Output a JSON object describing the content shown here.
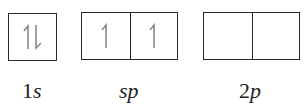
{
  "diagram": {
    "groups": [
      {
        "id": "1s",
        "label_num": "1",
        "label_letter": "s",
        "boxes": [
          {
            "electrons": [
              "up",
              "down"
            ]
          }
        ]
      },
      {
        "id": "sp",
        "label_num": "",
        "label_letter": "sp",
        "boxes": [
          {
            "electrons": [
              "up"
            ]
          },
          {
            "electrons": [
              "up"
            ]
          }
        ]
      },
      {
        "id": "2p",
        "label_num": "2",
        "label_letter": "p",
        "boxes": [
          {
            "electrons": []
          },
          {
            "electrons": []
          }
        ]
      }
    ],
    "colors": {
      "box_border": "#2a2a2a",
      "arrow": "#8a8a8a",
      "label": "#222222"
    }
  }
}
